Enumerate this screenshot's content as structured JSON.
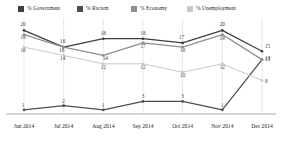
{
  "chart_data": {
    "type": "line",
    "title": "",
    "xlabel": "",
    "ylabel": "",
    "categories": [
      "Jun 2014",
      "Jul 2014",
      "Aug 2014",
      "Sep 2014",
      "Oct 2014",
      "Nov 2014",
      "Dec 2014"
    ],
    "ylim": [
      0,
      22
    ],
    "grid": true,
    "grid_orientation": "vertical",
    "legend_position": "top",
    "series": [
      {
        "name": "% Government",
        "color": "#3f3f3f",
        "values": [
          20,
          16,
          18,
          18,
          17,
          20,
          15
        ],
        "labels": [
          "20",
          "16",
          "18",
          "18",
          "17",
          "20",
          "15"
        ]
      },
      {
        "name": "% Racism",
        "color": "#4e4e4e",
        "values": [
          1,
          2,
          1,
          3,
          3,
          1,
          13
        ],
        "labels": [
          "1",
          "2",
          "1",
          "3",
          "3",
          "1",
          "13"
        ]
      },
      {
        "name": "% Economy",
        "color": "#8e8e8e",
        "values": [
          19,
          16,
          14,
          17,
          16,
          19,
          13
        ],
        "labels": [
          "19",
          "16",
          "14",
          "17",
          "16",
          "19",
          "13"
        ]
      },
      {
        "name": "% Unemployment",
        "color": "#c9c9c9",
        "values": [
          16,
          14,
          12,
          12,
          10,
          12,
          8
        ],
        "labels": [
          "16",
          "14",
          "12",
          "12",
          "10",
          "12",
          "8"
        ]
      }
    ]
  },
  "legend": {
    "items": [
      {
        "label": "% Government",
        "color": "#3f3f3f",
        "left": 18
      },
      {
        "label": "% Racism",
        "color": "#4e4e4e",
        "left": 77
      },
      {
        "label": "% Economy",
        "color": "#8e8e8e",
        "left": 131
      },
      {
        "label": "% Unemployment",
        "color": "#c9c9c9",
        "left": 187
      }
    ]
  },
  "axis": {
    "baseline_color": "#9a9a9a",
    "grid_color": "#d8d8d8"
  }
}
